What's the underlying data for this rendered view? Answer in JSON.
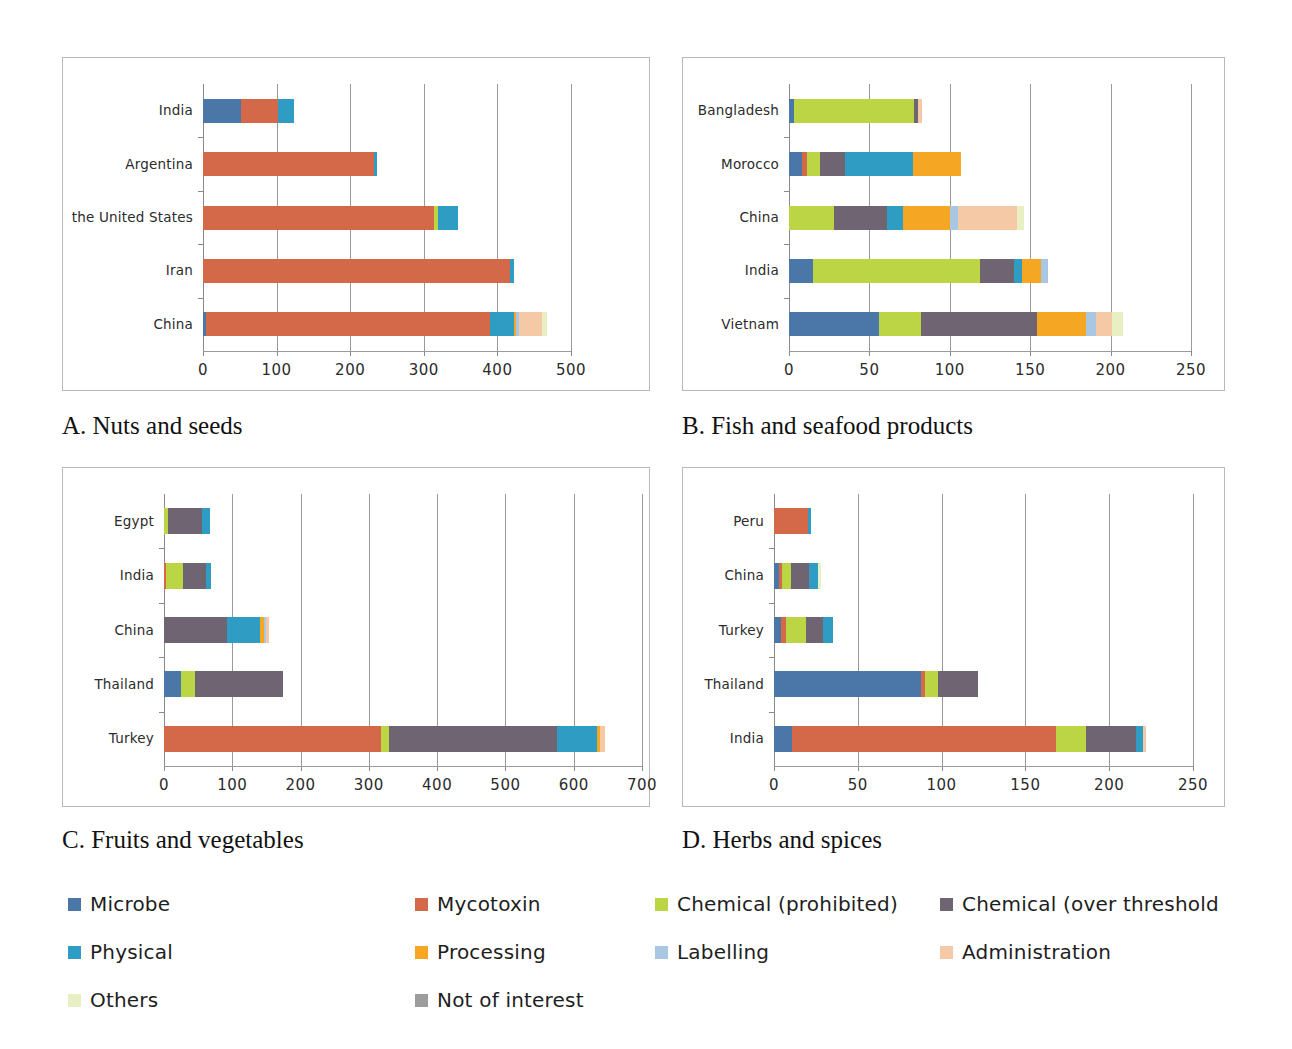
{
  "figure": {
    "title": "",
    "panel_captions": {
      "A": "A. Nuts and seeds",
      "B": "B. Fish and seafood products",
      "C": "C. Fruits and vegetables",
      "D": "D. Herbs and spices"
    }
  },
  "legend": {
    "position": "bottom",
    "entries": [
      {
        "label": "Microbe",
        "color": "#4a76a8"
      },
      {
        "label": "Mycotoxin",
        "color": "#d4694a"
      },
      {
        "label": "Chemical (prohibited)",
        "color": "#bcd545"
      },
      {
        "label": "Chemical (over threshold",
        "color": "#6f6572"
      },
      {
        "label": "Physical",
        "color": "#2f9cc4"
      },
      {
        "label": "Processing",
        "color": "#f5a623"
      },
      {
        "label": "Labelling",
        "color": "#a9c6e2"
      },
      {
        "label": "Administration",
        "color": "#f6c9a6"
      },
      {
        "label": "Others",
        "color": "#e8efc2"
      },
      {
        "label": "Not of interest",
        "color": "#9c9c9c"
      }
    ]
  },
  "chart_data": [
    {
      "id": "A",
      "type": "bar",
      "orientation": "horizontal",
      "stacked": true,
      "title": "A. Nuts and seeds",
      "xlabel": "",
      "ylabel": "",
      "xlim": [
        0,
        500
      ],
      "xticks": [
        0,
        100,
        200,
        300,
        400,
        500
      ],
      "xticklabels": [
        "0",
        "100",
        "200",
        "300",
        "400",
        "500"
      ],
      "grid": true,
      "categories": [
        "China",
        "Iran",
        "the United States",
        "Argentina",
        "India"
      ],
      "series": [
        {
          "name": "Microbe",
          "color": "#4a76a8",
          "values": [
            4,
            0,
            0,
            0,
            52
          ]
        },
        {
          "name": "Mycotoxin",
          "color": "#d4694a",
          "values": [
            386,
            417,
            314,
            232,
            50
          ]
        },
        {
          "name": "Chemical (prohibited)",
          "color": "#bcd545",
          "values": [
            0,
            0,
            5,
            0,
            0
          ]
        },
        {
          "name": "Chemical (over threshold",
          "color": "#6f6572",
          "values": [
            0,
            0,
            0,
            0,
            0
          ]
        },
        {
          "name": "Physical",
          "color": "#2f9cc4",
          "values": [
            32,
            6,
            27,
            5,
            22
          ]
        },
        {
          "name": "Processing",
          "color": "#f5a623",
          "values": [
            3,
            0,
            0,
            0,
            0
          ]
        },
        {
          "name": "Labelling",
          "color": "#a9c6e2",
          "values": [
            4,
            0,
            0,
            0,
            0
          ]
        },
        {
          "name": "Administration",
          "color": "#f6c9a6",
          "values": [
            32,
            0,
            0,
            0,
            0
          ]
        },
        {
          "name": "Others",
          "color": "#e8efc2",
          "values": [
            7,
            0,
            0,
            0,
            0
          ]
        },
        {
          "name": "Not of interest",
          "color": "#9c9c9c",
          "values": [
            0,
            0,
            0,
            0,
            0
          ]
        }
      ],
      "totals": [
        468,
        423,
        346,
        237,
        124
      ]
    },
    {
      "id": "B",
      "type": "bar",
      "orientation": "horizontal",
      "stacked": true,
      "title": "B. Fish and seafood products",
      "xlabel": "",
      "ylabel": "",
      "xlim": [
        0,
        250
      ],
      "xticks": [
        0,
        50,
        100,
        150,
        200,
        250
      ],
      "xticklabels": [
        "0",
        "50",
        "100",
        "150",
        "200",
        "250"
      ],
      "grid": true,
      "categories": [
        "Vietnam",
        "India",
        "China",
        "Morocco",
        "Bangladesh"
      ],
      "series": [
        {
          "name": "Microbe",
          "color": "#4a76a8",
          "values": [
            56,
            15,
            0,
            8,
            3
          ]
        },
        {
          "name": "Mycotoxin",
          "color": "#d4694a",
          "values": [
            0,
            0,
            0,
            3,
            0
          ]
        },
        {
          "name": "Chemical (prohibited)",
          "color": "#bcd545",
          "values": [
            26,
            104,
            28,
            8,
            75
          ]
        },
        {
          "name": "Chemical (over threshold",
          "color": "#6f6572",
          "values": [
            72,
            21,
            33,
            16,
            2
          ]
        },
        {
          "name": "Physical",
          "color": "#2f9cc4",
          "values": [
            0,
            5,
            10,
            42,
            0
          ]
        },
        {
          "name": "Processing",
          "color": "#f5a623",
          "values": [
            31,
            12,
            29,
            30,
            0
          ]
        },
        {
          "name": "Labelling",
          "color": "#a9c6e2",
          "values": [
            6,
            4,
            5,
            0,
            0
          ]
        },
        {
          "name": "Administration",
          "color": "#f6c9a6",
          "values": [
            10,
            0,
            37,
            0,
            3
          ]
        },
        {
          "name": "Others",
          "color": "#e8efc2",
          "values": [
            7,
            0,
            4,
            0,
            0
          ]
        },
        {
          "name": "Not of interest",
          "color": "#9c9c9c",
          "values": [
            0,
            0,
            0,
            0,
            0
          ]
        }
      ],
      "totals": [
        208,
        161,
        146,
        107,
        83
      ]
    },
    {
      "id": "C",
      "type": "bar",
      "orientation": "horizontal",
      "stacked": true,
      "title": "C. Fruits and vegetables",
      "xlabel": "",
      "ylabel": "",
      "xlim": [
        0,
        700
      ],
      "xticks": [
        0,
        100,
        200,
        300,
        400,
        500,
        600,
        700
      ],
      "xticklabels": [
        "0",
        "100",
        "200",
        "300",
        "400",
        "500",
        "600",
        "700"
      ],
      "grid": true,
      "categories": [
        "Turkey",
        "Thailand",
        "China",
        "India",
        "Egypt"
      ],
      "series": [
        {
          "name": "Microbe",
          "color": "#4a76a8",
          "values": [
            0,
            25,
            0,
            0,
            0
          ]
        },
        {
          "name": "Mycotoxin",
          "color": "#d4694a",
          "values": [
            318,
            0,
            0,
            3,
            0
          ]
        },
        {
          "name": "Chemical (prohibited)",
          "color": "#bcd545",
          "values": [
            12,
            20,
            0,
            25,
            6
          ]
        },
        {
          "name": "Chemical (over threshold",
          "color": "#6f6572",
          "values": [
            246,
            130,
            92,
            33,
            50
          ]
        },
        {
          "name": "Physical",
          "color": "#2f9cc4",
          "values": [
            58,
            0,
            48,
            8,
            12
          ]
        },
        {
          "name": "Processing",
          "color": "#f5a623",
          "values": [
            4,
            0,
            7,
            0,
            0
          ]
        },
        {
          "name": "Labelling",
          "color": "#a9c6e2",
          "values": [
            0,
            0,
            3,
            0,
            0
          ]
        },
        {
          "name": "Administration",
          "color": "#f6c9a6",
          "values": [
            8,
            0,
            4,
            0,
            0
          ]
        },
        {
          "name": "Others",
          "color": "#e8efc2",
          "values": [
            0,
            0,
            0,
            0,
            0
          ]
        },
        {
          "name": "Not of interest",
          "color": "#9c9c9c",
          "values": [
            0,
            0,
            0,
            0,
            0
          ]
        }
      ],
      "totals": [
        646,
        175,
        154,
        69,
        68
      ]
    },
    {
      "id": "D",
      "type": "bar",
      "orientation": "horizontal",
      "stacked": true,
      "title": "D. Herbs and spices",
      "xlabel": "",
      "ylabel": "",
      "xlim": [
        0,
        250
      ],
      "xticks": [
        0,
        50,
        100,
        150,
        200,
        250
      ],
      "xticklabels": [
        "0",
        "50",
        "100",
        "150",
        "200",
        "250"
      ],
      "grid": true,
      "categories": [
        "India",
        "Thailand",
        "Turkey",
        "China",
        "Peru"
      ],
      "series": [
        {
          "name": "Microbe",
          "color": "#4a76a8",
          "values": [
            11,
            88,
            4,
            3,
            0
          ]
        },
        {
          "name": "Mycotoxin",
          "color": "#d4694a",
          "values": [
            157,
            2,
            3,
            2,
            20
          ]
        },
        {
          "name": "Chemical (prohibited)",
          "color": "#bcd545",
          "values": [
            18,
            8,
            12,
            5,
            0
          ]
        },
        {
          "name": "Chemical (over threshold",
          "color": "#6f6572",
          "values": [
            30,
            24,
            10,
            11,
            0
          ]
        },
        {
          "name": "Physical",
          "color": "#2f9cc4",
          "values": [
            4,
            0,
            6,
            5,
            2
          ]
        },
        {
          "name": "Processing",
          "color": "#f5a623",
          "values": [
            0,
            0,
            0,
            0,
            0
          ]
        },
        {
          "name": "Labelling",
          "color": "#a9c6e2",
          "values": [
            0,
            0,
            0,
            0,
            0
          ]
        },
        {
          "name": "Administration",
          "color": "#f6c9a6",
          "values": [
            2,
            0,
            0,
            0,
            0
          ]
        },
        {
          "name": "Others",
          "color": "#e8efc2",
          "values": [
            0,
            0,
            0,
            2,
            0
          ]
        },
        {
          "name": "Not of interest",
          "color": "#9c9c9c",
          "values": [
            0,
            0,
            0,
            0,
            0
          ]
        }
      ],
      "totals": [
        222,
        122,
        35,
        28,
        22
      ]
    }
  ]
}
